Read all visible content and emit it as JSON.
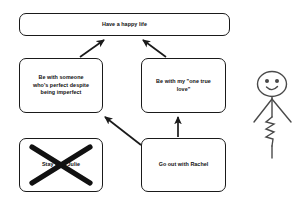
{
  "diagram": {
    "background_color": "#ffffff",
    "line_color": "#1a1a1a",
    "text_color": "#101010",
    "nodes": [
      {
        "id": "happy-life",
        "label": "Have a happy life",
        "state": "normal"
      },
      {
        "id": "perfect-despite",
        "label": "Be with someone\nwho's perfect despite\nbeing imperfect",
        "state": "normal"
      },
      {
        "id": "one-true-love",
        "label": "Be with my \"one true\nlove\"",
        "state": "normal"
      },
      {
        "id": "stay-with-julie",
        "label": "Stay with Julie",
        "state": "crossed-out"
      },
      {
        "id": "go-out-rachel",
        "label": "Go out with Rachel",
        "state": "normal"
      }
    ],
    "edges": [
      {
        "id": "edge-perfect-to-happy",
        "from": "perfect-despite",
        "to": "happy-life",
        "style": "arrow"
      },
      {
        "id": "edge-love-to-happy",
        "from": "one-true-love",
        "to": "happy-life",
        "style": "arrow"
      },
      {
        "id": "edge-rachel-to-perfect",
        "from": "go-out-rachel",
        "to": "perfect-despite",
        "style": "arrow"
      },
      {
        "id": "edge-rachel-to-love",
        "from": "go-out-rachel",
        "to": "one-true-love",
        "style": "arrow"
      }
    ],
    "figure": {
      "id": "stick-figure",
      "description": "smiling stick figure with zigzag body",
      "expression": "smiling"
    }
  }
}
